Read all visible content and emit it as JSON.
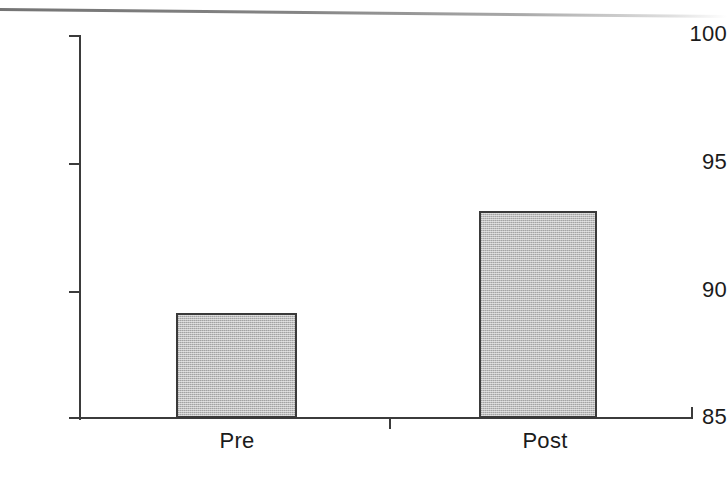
{
  "chart_data": {
    "type": "bar",
    "title": "",
    "subtitle": "",
    "xlabel": "",
    "ylabel": "",
    "categories": [
      "Pre",
      "Post"
    ],
    "values": [
      89.1,
      93.1
    ],
    "series": [
      {
        "name": "",
        "values": [
          89.1,
          93.1
        ]
      }
    ],
    "ylim": [
      85,
      100
    ],
    "yticks": [
      85,
      90,
      95,
      100
    ],
    "ytick_labels": [
      "85",
      "90",
      "95",
      "100"
    ],
    "grid": false,
    "legend": false,
    "legend_position": "none",
    "bar_fill_color": "#bdbdbd",
    "bar_border_color": "#3a3a3a",
    "axis_color": "#3b3b3b",
    "text_color": "#1b1b1b",
    "background_color": "#ffffff",
    "annotations": []
  }
}
